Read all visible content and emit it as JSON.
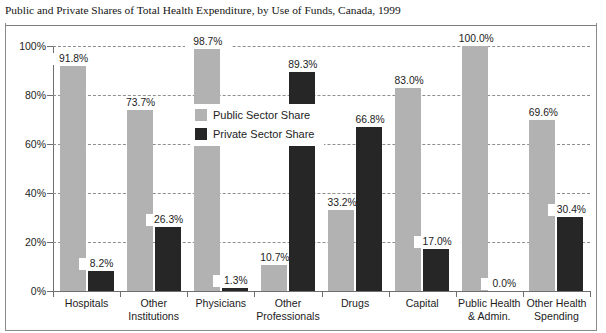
{
  "chart_data": {
    "type": "bar",
    "title": "Public and Private Shares of Total Health Expenditure, by Use of Funds, Canada, 1999",
    "xlabel": "",
    "ylabel": "",
    "ylim": [
      0,
      100
    ],
    "ytick_labels": [
      "0%",
      "20%",
      "40%",
      "60%",
      "80%",
      "100%"
    ],
    "ytick_values": [
      0,
      20,
      40,
      60,
      80,
      100
    ],
    "grid": true,
    "legend_position": "inside-upper-center",
    "categories": [
      "Hospitals",
      "Other Institutions",
      "Physicians",
      "Other Professionals",
      "Drugs",
      "Capital",
      "Public Health & Admin.",
      "Other Health Spending"
    ],
    "category_lines": [
      [
        "Hospitals"
      ],
      [
        "Other",
        "Institutions"
      ],
      [
        "Physicians"
      ],
      [
        "Other",
        "Professionals"
      ],
      [
        "Drugs"
      ],
      [
        "Capital"
      ],
      [
        "Public Health",
        "& Admin."
      ],
      [
        "Other Health",
        "Spending"
      ]
    ],
    "series": [
      {
        "name": "Public Sector Share",
        "color": "#b2b2b2",
        "values": [
          91.8,
          73.7,
          98.7,
          10.7,
          33.2,
          83.0,
          100.0,
          69.6
        ],
        "labels": [
          "91.8%",
          "73.7%",
          "98.7%",
          "10.7%",
          "33.2%",
          "83.0%",
          "100.0%",
          "69.6%"
        ]
      },
      {
        "name": "Private Sector Share",
        "color": "#262626",
        "values": [
          8.2,
          26.3,
          1.3,
          89.3,
          66.8,
          17.0,
          0.0,
          30.4
        ],
        "labels": [
          "8.2%",
          "26.3%",
          "1.3%",
          "89.3%",
          "66.8%",
          "17.0%",
          "0.0%",
          "30.4%"
        ]
      }
    ]
  },
  "legend": {
    "items": [
      {
        "label": "Public Sector Share",
        "color": "#b2b2b2"
      },
      {
        "label": "Private Sector Share",
        "color": "#262626"
      }
    ]
  }
}
